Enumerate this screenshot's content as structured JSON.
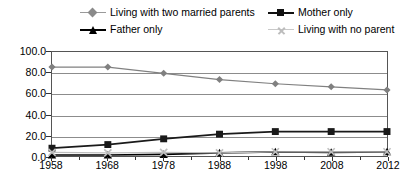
{
  "chart_data": {
    "type": "line",
    "title": "",
    "xlabel": "",
    "ylabel": "",
    "categories": [
      "1958",
      "1968",
      "1978",
      "1988",
      "1998",
      "2008",
      "2012"
    ],
    "x_tick_labels": [
      "1958",
      "1968",
      "1978",
      "1988",
      "1998",
      "2008",
      "2012"
    ],
    "y_tick_labels": [
      "100.0",
      "80.0",
      "60.0",
      "40.0",
      "20.0",
      "0.0"
    ],
    "y_tick_values": [
      100.0,
      80.0,
      60.0,
      40.0,
      20.0,
      0.0
    ],
    "ylim": [
      0,
      100
    ],
    "grid": true,
    "legend_position": "top",
    "series": [
      {
        "name": "Living with two married parents",
        "marker": "diamond",
        "color": "#808080",
        "values": [
          85.5,
          85.5,
          79.5,
          73.5,
          69.5,
          66.5,
          63.5
        ]
      },
      {
        "name": "Mother only",
        "marker": "square",
        "color": "#1a1a1a",
        "values": [
          7.5,
          11.0,
          16.5,
          21.0,
          23.5,
          23.5,
          23.5
        ]
      },
      {
        "name": "Father only",
        "marker": "triangle",
        "color": "#000000",
        "values": [
          1.0,
          1.0,
          1.5,
          3.0,
          4.0,
          3.5,
          4.0
        ]
      },
      {
        "name": "Living with no parent",
        "marker": "x",
        "color": "#bfbfbf",
        "values": [
          3.5,
          3.0,
          3.5,
          3.0,
          4.0,
          4.0,
          4.0
        ]
      }
    ]
  },
  "legend": {
    "items": [
      {
        "label": "Living with two married parents",
        "marker": "diamond-marker",
        "color": "#808080"
      },
      {
        "label": "Mother only",
        "marker": "square-marker",
        "color": "#1a1a1a"
      },
      {
        "label": "Father only",
        "marker": "triangle-marker",
        "color": "#000000"
      },
      {
        "label": "Living with no parent",
        "marker": "x-marker",
        "color": "#bfbfbf"
      }
    ]
  },
  "colors": {
    "gridline": "#8c8c8c",
    "axis": "#555555",
    "background": "#ffffff"
  }
}
